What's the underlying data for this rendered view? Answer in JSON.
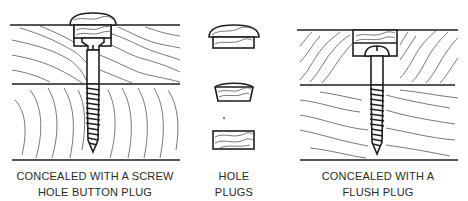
{
  "figure": {
    "panels": [
      {
        "id": "button-plug",
        "caption_lines": [
          "CONCEALED WITH A SCREW",
          "HOLE BUTTON PLUG"
        ]
      },
      {
        "id": "hole-plugs",
        "caption_lines": [
          "HOLE",
          "PLUGS"
        ],
        "plug_types": [
          "button",
          "tapered",
          "flush"
        ]
      },
      {
        "id": "flush-plug",
        "caption_lines": [
          "CONCEALED WITH A",
          "FLUSH PLUG"
        ]
      }
    ],
    "colors": {
      "ink": "#1e1e1e",
      "background": "#ffffff"
    }
  }
}
